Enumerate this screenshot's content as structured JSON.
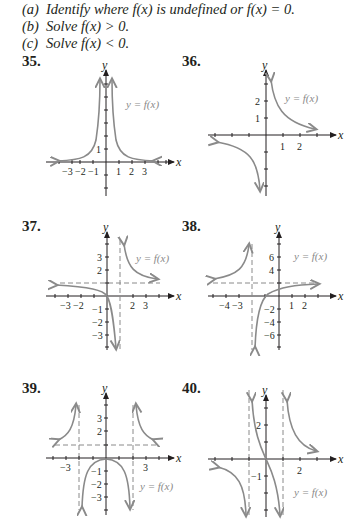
{
  "instructions": [
    {
      "label": "(a)",
      "text": "Identify where f(x) is undefined or f(x) = 0."
    },
    {
      "label": "(b)",
      "text": "Solve f(x) > 0."
    },
    {
      "label": "(c)",
      "text": "Solve f(x) < 0."
    }
  ],
  "problems": [
    {
      "number": "35.",
      "function_label": "y = f(x)",
      "x_axis": "x",
      "y_axis": "y",
      "x_ticks": [
        "−3",
        "−2",
        "−1",
        "1",
        "2",
        "3"
      ],
      "y_ticks": [
        "1"
      ]
    },
    {
      "number": "36.",
      "function_label": "y = f(x)",
      "x_axis": "x",
      "y_axis": "y",
      "x_ticks": [
        "1",
        "2"
      ],
      "y_ticks": [
        "2",
        "1"
      ]
    },
    {
      "number": "37.",
      "function_label": "y = f(x)",
      "x_axis": "x",
      "y_axis": "y",
      "x_ticks": [
        "−3",
        "−2",
        "2",
        "3"
      ],
      "y_ticks": [
        "3",
        "2",
        "−1",
        "−2",
        "−3"
      ]
    },
    {
      "number": "38.",
      "function_label": "y = f(x)",
      "x_axis": "x",
      "y_axis": "y",
      "x_ticks": [
        "−4",
        "−3",
        "1",
        "2"
      ],
      "y_ticks": [
        "6",
        "4",
        "−2",
        "−4",
        "−6"
      ]
    },
    {
      "number": "39.",
      "function_label": "y = f(x)",
      "x_axis": "x",
      "y_axis": "y",
      "x_ticks": [
        "−3",
        "3"
      ],
      "y_ticks": [
        "3",
        "2",
        "−1",
        "−2",
        "−3"
      ]
    },
    {
      "number": "40.",
      "function_label": "y = f(x)",
      "x_axis": "x",
      "y_axis": "y",
      "x_ticks": [
        "2"
      ],
      "y_ticks": [
        "2",
        "−1"
      ]
    }
  ],
  "colors": {
    "text": "#231f20",
    "curve": "#8a8a8a",
    "background": "#ffffff"
  }
}
